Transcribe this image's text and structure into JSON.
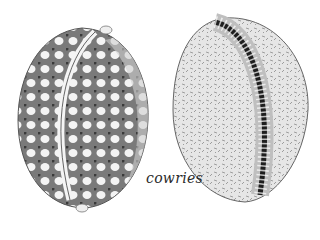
{
  "illustration": {
    "caption": "cowries",
    "shells": [
      {
        "name": "cowrie-dorsal-view",
        "pattern": "spotted"
      },
      {
        "name": "cowrie-ventral-view",
        "pattern": "toothed aperture"
      }
    ],
    "colors": {
      "ink": "#2a2a2a",
      "shade": "#8a8a8a",
      "light": "#d8d8d8",
      "background": "#ffffff"
    }
  }
}
